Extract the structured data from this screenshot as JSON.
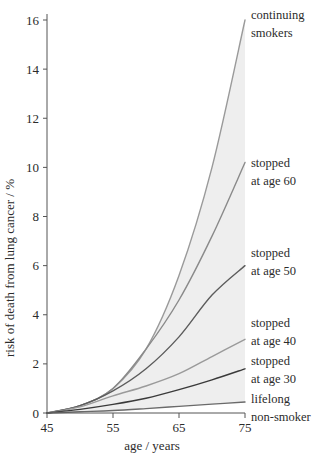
{
  "chart_data": {
    "type": "line",
    "title": "",
    "xlabel": "age / years",
    "ylabel": "risk of death from lung cancer / %",
    "xlim": [
      45,
      75
    ],
    "ylim": [
      0,
      16
    ],
    "xticks": [
      45,
      55,
      65,
      75
    ],
    "yticks": [
      0,
      2,
      4,
      6,
      8,
      10,
      12,
      14,
      16
    ],
    "xtick_labels": [
      "45",
      "55",
      "65",
      "75"
    ],
    "ytick_labels": [
      "0",
      "2",
      "4",
      "6",
      "8",
      "10",
      "12",
      "14",
      "16"
    ],
    "grid": false,
    "legend_position": "right-inline-annotations",
    "shaded_band": {
      "description": "light grey fill between continuing smokers and lifelong non-smoker curves",
      "color": "#eeeeee",
      "upper_series": "continuing smokers",
      "lower_series": "lifelong non-smoker"
    },
    "x": [
      45,
      50,
      55,
      60,
      65,
      70,
      75
    ],
    "series": [
      {
        "name": "continuing smokers",
        "label_line1": "continuing",
        "label_line2": "smokers",
        "color": "#9a9a9a",
        "values": [
          0,
          0.3,
          1.0,
          2.6,
          5.6,
          10.0,
          16.0
        ]
      },
      {
        "name": "stopped at age 60",
        "label_line1": "stopped",
        "label_line2": "at age 60",
        "color": "#8a8a8a",
        "values": [
          0,
          0.3,
          1.0,
          2.6,
          4.6,
          7.2,
          10.2
        ]
      },
      {
        "name": "stopped at age 50",
        "label_line1": "stopped",
        "label_line2": "at age 50",
        "color": "#5c5c5c",
        "values": [
          0,
          0.3,
          0.9,
          1.8,
          3.1,
          4.8,
          6.0
        ]
      },
      {
        "name": "stopped at age 40",
        "label_line1": "stopped",
        "label_line2": "at age 40",
        "color": "#9a9a9a",
        "values": [
          0,
          0.25,
          0.7,
          1.1,
          1.6,
          2.3,
          3.0
        ]
      },
      {
        "name": "stopped at age 30",
        "label_line1": "stopped",
        "label_line2": "at age 30",
        "color": "#3a3a3a",
        "values": [
          0,
          0.15,
          0.35,
          0.6,
          0.95,
          1.35,
          1.8
        ]
      },
      {
        "name": "lifelong non-smoker",
        "label_line1": "lifelong",
        "label_line2": "non-smoker",
        "color": "#6a6a6a",
        "values": [
          0,
          0.05,
          0.1,
          0.18,
          0.27,
          0.36,
          0.45
        ]
      }
    ]
  },
  "axes": {
    "y_axis_title": "risk of death from lung cancer / %",
    "x_axis_title": "age / years"
  },
  "annotations": [
    {
      "id": "continuing-smokers",
      "line1": "continuing",
      "line2": "smokers"
    },
    {
      "id": "stopped-60",
      "line1": "stopped",
      "line2": "at age 60"
    },
    {
      "id": "stopped-50",
      "line1": "stopped",
      "line2": "at age 50"
    },
    {
      "id": "stopped-40",
      "line1": "stopped",
      "line2": "at age 40"
    },
    {
      "id": "stopped-30",
      "line1": "stopped",
      "line2": "at age 30"
    },
    {
      "id": "non-smoker",
      "line1": "lifelong",
      "line2": "non-smoker"
    }
  ]
}
